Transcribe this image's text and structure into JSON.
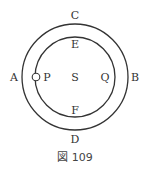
{
  "figure": {
    "caption": "図 109",
    "labels": {
      "A": "A",
      "B": "B",
      "C": "C",
      "D": "D",
      "E": "E",
      "F": "F",
      "P": "P",
      "Q": "Q",
      "S": "S"
    },
    "elements": {
      "outer_circle": "outer orbit",
      "inner_circle": "inner orbit",
      "small_body": "body at P"
    },
    "colors": {
      "stroke": "#333333",
      "background": "#ffffff"
    }
  }
}
